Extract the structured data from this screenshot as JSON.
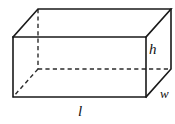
{
  "figure": {
    "name": "rectangular-prism",
    "type": "geometry-diagram",
    "background_color": "#ffffff",
    "line_color": "#1a1a1a",
    "hidden_line_color": "#2b2b2b",
    "label_color": "#111111"
  },
  "labels": {
    "height": "h",
    "width": "w",
    "length": "l"
  },
  "geometry": {
    "front_face": {
      "top_left": [
        13,
        37
      ],
      "top_right": [
        146,
        37
      ],
      "bottom_right": [
        146,
        97
      ],
      "bottom_left": [
        13,
        97
      ]
    },
    "back_face": {
      "top_left": [
        38,
        9
      ],
      "top_right": [
        171,
        9
      ],
      "bottom_right": [
        171,
        69
      ],
      "bottom_left": [
        38,
        69
      ]
    },
    "hidden_vertex": [
      38,
      69
    ],
    "visible_faces": [
      "front",
      "top",
      "right"
    ],
    "hidden_edges": [
      "back-left-vertical",
      "back-bottom-horizontal",
      "back-bottom-left-diagonal"
    ]
  }
}
